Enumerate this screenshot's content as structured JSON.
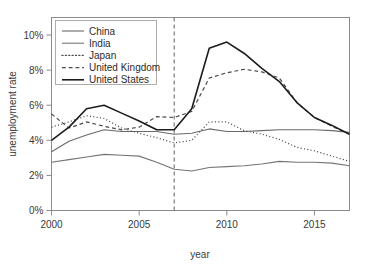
{
  "chart_data": {
    "type": "line",
    "title": "",
    "xlabel": "year",
    "ylabel": "unemployment rate",
    "xlim": [
      2000,
      2017
    ],
    "ylim": [
      0,
      11
    ],
    "grid": false,
    "legend_position": "top-left",
    "x": [
      2000,
      2001,
      2002,
      2003,
      2004,
      2005,
      2006,
      2007,
      2008,
      2009,
      2010,
      2011,
      2012,
      2013,
      2014,
      2015,
      2016,
      2017
    ],
    "xticks": [
      2000,
      2005,
      2010,
      2015
    ],
    "xtick_labels": [
      "2000",
      "2005",
      "2010",
      "2015"
    ],
    "yticks": [
      0,
      2,
      4,
      6,
      8,
      10
    ],
    "ytick_labels": [
      "0%",
      "2%",
      "4%",
      "6%",
      "8%",
      "10%"
    ],
    "annotations": [
      {
        "name": "reference-line-2007",
        "type": "vline",
        "x": 2007,
        "style": "dashed",
        "color": "#6e6e6e"
      }
    ],
    "series": [
      {
        "name": "China",
        "style": "solid",
        "color": "#6a6a6a",
        "width": 1.1,
        "values": [
          3.35,
          3.95,
          4.3,
          4.6,
          4.5,
          4.5,
          4.5,
          4.35,
          4.4,
          4.65,
          4.5,
          4.5,
          4.55,
          4.6,
          4.6,
          4.6,
          4.55,
          4.45
        ]
      },
      {
        "name": "India",
        "style": "solid",
        "color": "#757575",
        "width": 1.1,
        "values": [
          2.75,
          2.9,
          3.05,
          3.2,
          3.15,
          3.1,
          2.75,
          2.35,
          2.25,
          2.45,
          2.5,
          2.55,
          2.65,
          2.8,
          2.75,
          2.75,
          2.7,
          2.55
        ]
      },
      {
        "name": "Japan",
        "style": "dotted",
        "color": "#4a4a4a",
        "width": 1.2,
        "values": [
          4.75,
          5.05,
          5.4,
          5.25,
          4.7,
          4.4,
          4.15,
          3.85,
          4.0,
          5.05,
          5.05,
          4.55,
          4.35,
          4.05,
          3.6,
          3.4,
          3.1,
          2.8
        ]
      },
      {
        "name": "United Kingdom",
        "style": "dashed",
        "color": "#4a4a4a",
        "width": 1.2,
        "values": [
          5.5,
          4.7,
          5.05,
          4.8,
          4.6,
          4.75,
          5.35,
          5.3,
          5.65,
          7.55,
          7.85,
          8.05,
          7.9,
          7.55,
          6.15,
          5.3,
          4.8,
          4.35
        ]
      },
      {
        "name": "United States",
        "style": "solid",
        "color": "#1c1c1c",
        "width": 1.6,
        "values": [
          4.0,
          4.75,
          5.8,
          6.0,
          5.55,
          5.1,
          4.6,
          4.6,
          5.8,
          9.25,
          9.6,
          8.95,
          8.1,
          7.35,
          6.15,
          5.3,
          4.85,
          4.35
        ]
      }
    ]
  },
  "legend": {
    "entries": [
      {
        "label": "China"
      },
      {
        "label": "India"
      },
      {
        "label": "Japan"
      },
      {
        "label": "United Kingdom"
      },
      {
        "label": "United States"
      }
    ]
  }
}
